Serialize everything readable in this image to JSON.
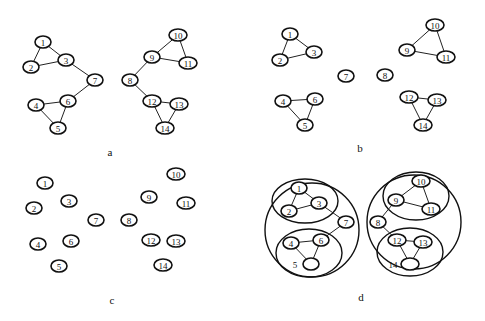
{
  "panels": [
    {
      "id": "a",
      "caption": "a",
      "caption_pos": [
        110,
        152
      ],
      "nodes": [
        {
          "id": "1",
          "x": 43,
          "y": 42
        },
        {
          "id": "2",
          "x": 31,
          "y": 67
        },
        {
          "id": "3",
          "x": 66,
          "y": 60
        },
        {
          "id": "4",
          "x": 36,
          "y": 105
        },
        {
          "id": "5",
          "x": 58,
          "y": 128
        },
        {
          "id": "6",
          "x": 68,
          "y": 101
        },
        {
          "id": "7",
          "x": 95,
          "y": 80
        },
        {
          "id": "8",
          "x": 130,
          "y": 80
        },
        {
          "id": "9",
          "x": 152,
          "y": 57
        },
        {
          "id": "10",
          "x": 178,
          "y": 35
        },
        {
          "id": "11",
          "x": 188,
          "y": 63
        },
        {
          "id": "12",
          "x": 152,
          "y": 101
        },
        {
          "id": "13",
          "x": 179,
          "y": 104
        },
        {
          "id": "14",
          "x": 165,
          "y": 128
        }
      ],
      "edges": [
        [
          "1",
          "2"
        ],
        [
          "1",
          "3"
        ],
        [
          "2",
          "3"
        ],
        [
          "3",
          "7"
        ],
        [
          "7",
          "6"
        ],
        [
          "4",
          "6"
        ],
        [
          "4",
          "5"
        ],
        [
          "5",
          "6"
        ],
        [
          "8",
          "9"
        ],
        [
          "9",
          "10"
        ],
        [
          "9",
          "11"
        ],
        [
          "10",
          "11"
        ],
        [
          "8",
          "12"
        ],
        [
          "12",
          "13"
        ],
        [
          "12",
          "14"
        ],
        [
          "13",
          "14"
        ]
      ],
      "groups": []
    },
    {
      "id": "b",
      "caption": "b",
      "caption_pos": [
        360,
        148
      ],
      "nodes": [
        {
          "id": "1",
          "x": 290,
          "y": 34
        },
        {
          "id": "2",
          "x": 280,
          "y": 60
        },
        {
          "id": "3",
          "x": 314,
          "y": 52
        },
        {
          "id": "4",
          "x": 283,
          "y": 101
        },
        {
          "id": "5",
          "x": 305,
          "y": 125
        },
        {
          "id": "6",
          "x": 315,
          "y": 99
        },
        {
          "id": "7",
          "x": 346,
          "y": 76
        },
        {
          "id": "8",
          "x": 385,
          "y": 75
        },
        {
          "id": "9",
          "x": 407,
          "y": 50
        },
        {
          "id": "10",
          "x": 435,
          "y": 25
        },
        {
          "id": "11",
          "x": 446,
          "y": 57
        },
        {
          "id": "12",
          "x": 409,
          "y": 97
        },
        {
          "id": "13",
          "x": 437,
          "y": 100
        },
        {
          "id": "14",
          "x": 423,
          "y": 125
        }
      ],
      "edges": [
        [
          "1",
          "2"
        ],
        [
          "1",
          "3"
        ],
        [
          "2",
          "3"
        ],
        [
          "4",
          "6"
        ],
        [
          "4",
          "5"
        ],
        [
          "5",
          "6"
        ],
        [
          "9",
          "10"
        ],
        [
          "9",
          "11"
        ],
        [
          "10",
          "11"
        ],
        [
          "12",
          "13"
        ],
        [
          "12",
          "14"
        ],
        [
          "13",
          "14"
        ]
      ],
      "groups": []
    },
    {
      "id": "c",
      "caption": "c",
      "caption_pos": [
        112,
        300
      ],
      "nodes": [
        {
          "id": "1",
          "x": 45,
          "y": 183
        },
        {
          "id": "2",
          "x": 34,
          "y": 208
        },
        {
          "id": "3",
          "x": 69,
          "y": 201
        },
        {
          "id": "4",
          "x": 38,
          "y": 244
        },
        {
          "id": "5",
          "x": 59,
          "y": 266
        },
        {
          "id": "6",
          "x": 71,
          "y": 241
        },
        {
          "id": "7",
          "x": 96,
          "y": 220
        },
        {
          "id": "8",
          "x": 129,
          "y": 220
        },
        {
          "id": "9",
          "x": 149,
          "y": 197
        },
        {
          "id": "10",
          "x": 176,
          "y": 174
        },
        {
          "id": "11",
          "x": 186,
          "y": 203
        },
        {
          "id": "12",
          "x": 151,
          "y": 240
        },
        {
          "id": "13",
          "x": 176,
          "y": 241
        },
        {
          "id": "14",
          "x": 163,
          "y": 265
        }
      ],
      "edges": [],
      "groups": []
    },
    {
      "id": "d",
      "caption": "d",
      "caption_pos": [
        361,
        297
      ],
      "nodes": [
        {
          "id": "1",
          "x": 299,
          "y": 188
        },
        {
          "id": "2",
          "x": 289,
          "y": 211
        },
        {
          "id": "3",
          "x": 319,
          "y": 203
        },
        {
          "id": "4",
          "x": 291,
          "y": 243
        },
        {
          "id": "5",
          "x": 311,
          "y": 264,
          "label": "",
          "ext_label": "5",
          "ext_x": 295,
          "ext_y": 265
        },
        {
          "id": "6",
          "x": 321,
          "y": 240
        },
        {
          "id": "7",
          "x": 346,
          "y": 222
        },
        {
          "id": "8",
          "x": 378,
          "y": 222
        },
        {
          "id": "9",
          "x": 396,
          "y": 200
        },
        {
          "id": "10",
          "x": 421,
          "y": 181
        },
        {
          "id": "11",
          "x": 431,
          "y": 209
        },
        {
          "id": "12",
          "x": 397,
          "y": 240
        },
        {
          "id": "13",
          "x": 423,
          "y": 242
        },
        {
          "id": "14",
          "x": 410,
          "y": 264,
          "label": "",
          "ext_label": "14",
          "ext_x": 393,
          "ext_y": 265
        }
      ],
      "edges": [
        [
          "1",
          "2"
        ],
        [
          "1",
          "3"
        ],
        [
          "2",
          "3"
        ],
        [
          "3",
          "7"
        ],
        [
          "7",
          "6"
        ],
        [
          "4",
          "6"
        ],
        [
          "4",
          "5"
        ],
        [
          "5",
          "6"
        ],
        [
          "8",
          "9"
        ],
        [
          "9",
          "10"
        ],
        [
          "9",
          "11"
        ],
        [
          "10",
          "11"
        ],
        [
          "8",
          "12"
        ],
        [
          "12",
          "13"
        ],
        [
          "12",
          "14"
        ],
        [
          "13",
          "14"
        ]
      ],
      "groups": [
        {
          "cx": 312,
          "cy": 230,
          "rx": 47,
          "ry": 47
        },
        {
          "cx": 305,
          "cy": 201,
          "rx": 33,
          "ry": 22
        },
        {
          "cx": 309,
          "cy": 253,
          "rx": 33,
          "ry": 24
        },
        {
          "cx": 414,
          "cy": 222,
          "rx": 47,
          "ry": 47
        },
        {
          "cx": 416,
          "cy": 196,
          "rx": 33,
          "ry": 24
        },
        {
          "cx": 410,
          "cy": 252,
          "rx": 33,
          "ry": 24
        }
      ]
    }
  ]
}
